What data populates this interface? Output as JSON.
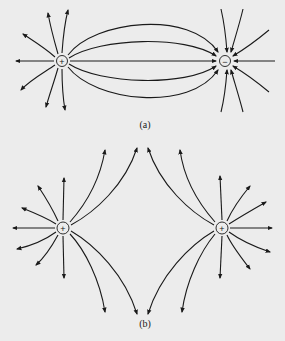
{
  "figure": {
    "panels": [
      {
        "id": "a",
        "label": "(a)",
        "description": "Electric field lines between a positive and a negative point charge",
        "charges": [
          {
            "sign": "+",
            "symbol": "+",
            "x": 62,
            "y": 61
          },
          {
            "sign": "-",
            "symbol": "−",
            "x": 225,
            "y": 61
          }
        ]
      },
      {
        "id": "b",
        "label": "(b)",
        "description": "Electric field lines of two equal positive point charges",
        "charges": [
          {
            "sign": "+",
            "symbol": "+",
            "x": 63,
            "y": 228
          },
          {
            "sign": "+",
            "symbol": "+",
            "x": 222,
            "y": 228
          }
        ]
      }
    ],
    "colors": {
      "background": "#ececec",
      "ink": "#1a1a1a"
    }
  }
}
